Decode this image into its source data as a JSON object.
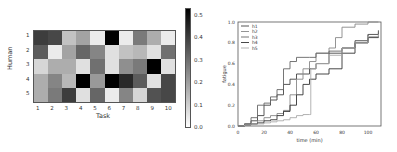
{
  "chart_data": [
    {
      "type": "heatmap",
      "title": "",
      "xlabel": "Task",
      "ylabel": "Human",
      "x_categories": [
        "1",
        "2",
        "3",
        "4",
        "5",
        "6",
        "7",
        "8",
        "9",
        "10"
      ],
      "y_categories": [
        "1",
        "2",
        "3",
        "4",
        "5"
      ],
      "values": [
        [
          0.38,
          0.36,
          0.12,
          0.18,
          0.04,
          0.5,
          0.04,
          0.26,
          0.16,
          0.04
        ],
        [
          0.32,
          0.04,
          0.18,
          0.3,
          0.24,
          0.06,
          0.12,
          0.14,
          0.06,
          0.28
        ],
        [
          0.08,
          0.16,
          0.16,
          0.06,
          0.28,
          0.06,
          0.22,
          0.26,
          0.5,
          0.06
        ],
        [
          0.16,
          0.24,
          0.14,
          0.5,
          0.2,
          0.55,
          0.42,
          0.32,
          0.06,
          0.36
        ],
        [
          0.16,
          0.26,
          0.38,
          0.06,
          0.3,
          0.04,
          0.24,
          0.08,
          0.34,
          0.36
        ]
      ],
      "colorbar": {
        "min": 0.0,
        "max": 0.5,
        "ticks": [
          "0.0",
          "0.1",
          "0.2",
          "0.3",
          "0.4",
          "0.5"
        ],
        "colormap": "Greys"
      }
    },
    {
      "type": "line",
      "title": "",
      "xlabel": "time (min)",
      "ylabel": "fatigue",
      "xlim": [
        0,
        110
      ],
      "ylim": [
        0,
        1.0
      ],
      "xticks": [
        "0",
        "20",
        "40",
        "60",
        "80",
        "100"
      ],
      "yticks": [
        "0.0",
        "0.2",
        "0.4",
        "0.6",
        "0.8",
        "1.0"
      ],
      "legend_position": "upper left",
      "series": [
        {
          "name": "h1",
          "color": "#444444",
          "x": [
            0,
            5,
            10,
            15,
            20,
            25,
            30,
            35,
            40,
            45,
            50,
            55,
            60,
            70,
            80,
            90,
            100,
            108
          ],
          "y": [
            0,
            0.02,
            0.05,
            0.1,
            0.2,
            0.25,
            0.3,
            0.4,
            0.45,
            0.5,
            0.5,
            0.55,
            0.6,
            0.7,
            0.75,
            0.82,
            0.88,
            0.92
          ]
        },
        {
          "name": "h2",
          "color": "#888888",
          "x": [
            0,
            5,
            10,
            15,
            20,
            25,
            30,
            35,
            40,
            45,
            50,
            55,
            60,
            70,
            75,
            80,
            90,
            100,
            108
          ],
          "y": [
            0,
            0.01,
            0.02,
            0.05,
            0.08,
            0.1,
            0.12,
            0.15,
            0.3,
            0.45,
            0.55,
            0.62,
            0.7,
            0.75,
            0.85,
            0.95,
            0.98,
            1.0,
            1.0
          ]
        },
        {
          "name": "h3",
          "color": "#666666",
          "x": [
            0,
            5,
            10,
            15,
            20,
            25,
            30,
            35,
            40,
            45,
            50,
            55,
            60,
            70,
            80,
            90,
            100,
            108
          ],
          "y": [
            0,
            0.02,
            0.08,
            0.2,
            0.22,
            0.28,
            0.35,
            0.55,
            0.62,
            0.66,
            0.66,
            0.66,
            0.7,
            0.72,
            0.75,
            0.8,
            0.88,
            0.9
          ]
        },
        {
          "name": "h4",
          "color": "#333333",
          "x": [
            0,
            5,
            10,
            15,
            20,
            25,
            30,
            35,
            40,
            45,
            50,
            55,
            60,
            70,
            80,
            90,
            100,
            108
          ],
          "y": [
            0,
            0.01,
            0.02,
            0.03,
            0.05,
            0.06,
            0.1,
            0.14,
            0.2,
            0.3,
            0.4,
            0.45,
            0.5,
            0.55,
            0.7,
            0.8,
            0.85,
            0.87
          ]
        },
        {
          "name": "h5",
          "color": "#aaaaaa",
          "x": [
            0,
            5,
            10,
            15,
            20,
            25,
            30,
            35,
            40,
            45,
            50,
            55,
            56,
            60,
            70,
            80,
            90,
            100,
            108
          ],
          "y": [
            0,
            0.01,
            0.02,
            0.02,
            0.03,
            0.04,
            0.05,
            0.06,
            0.08,
            0.1,
            0.11,
            0.11,
            0.55,
            0.6,
            0.68,
            0.75,
            0.8,
            0.86,
            0.88
          ]
        }
      ]
    }
  ]
}
